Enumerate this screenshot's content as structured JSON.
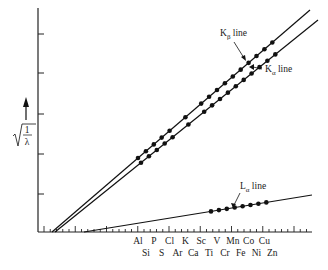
{
  "figure": {
    "y_axis_label": "√(1/λ)",
    "y_axis_label_numerator": "1",
    "y_axis_label_denominator": "λ",
    "x_axis_elements_row1": [
      "Al",
      "P",
      "Cl",
      "K",
      "Sc",
      "V",
      "Mn",
      "Co",
      "Cu"
    ],
    "x_axis_elements_row2": [
      "Si",
      "S",
      "Ar",
      "Ca",
      "Ti",
      "Cr",
      "Fe",
      "Ni",
      "Zn"
    ],
    "lines": {
      "k_beta": {
        "label_main": "K",
        "label_sub": "β",
        "label_suffix": " line"
      },
      "k_alpha": {
        "label_main": "K",
        "label_sub": "α",
        "label_suffix": " line"
      },
      "l_alpha": {
        "label_main": "L",
        "label_sub": "α",
        "label_suffix": " line"
      }
    }
  },
  "chart_data": {
    "type": "line",
    "xlabel": "Element (atomic number)",
    "ylabel": "√(1/λ)",
    "x_categories": [
      "Al",
      "Si",
      "P",
      "S",
      "Cl",
      "Ar",
      "K",
      "Ca",
      "Sc",
      "Ti",
      "V",
      "Cr",
      "Mn",
      "Fe",
      "Co",
      "Ni",
      "Cu",
      "Zn"
    ],
    "series": [
      {
        "name": "Kβ line",
        "type": "linear",
        "points_shown_from": "Al",
        "points_shown_to": "Zn"
      },
      {
        "name": "Kα line",
        "type": "linear",
        "points_shown_from": "Al",
        "points_shown_to": "Zn"
      },
      {
        "name": "Lα line",
        "type": "linear",
        "points_shown_from": "V",
        "points_shown_to": "Zn"
      }
    ],
    "grid": false,
    "y_ticks_count": 5
  }
}
